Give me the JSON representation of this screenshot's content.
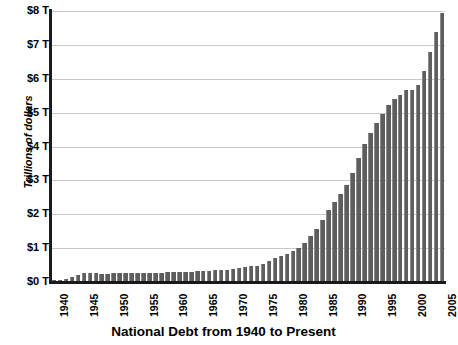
{
  "chart_data": {
    "type": "bar",
    "title": "National Debt from 1940 to Present",
    "xlabel": "",
    "ylabel": "Trillions of dollars",
    "ylim": [
      0,
      8
    ],
    "grid": true,
    "legend": "none",
    "y_ticks": [
      "$0 T",
      "$1 T",
      "$2 T",
      "$3 T",
      "$4 T",
      "$5 T",
      "$6 T",
      "$7 T",
      "$8 T"
    ],
    "y_tick_values": [
      0,
      1,
      2,
      3,
      4,
      5,
      6,
      7,
      8
    ],
    "x_tick_labels": [
      "1940",
      "1945",
      "1950",
      "1955",
      "1960",
      "1965",
      "1970",
      "1975",
      "1980",
      "1985",
      "1990",
      "1995",
      "2000",
      "2005"
    ],
    "x_tick_values": [
      1940,
      1945,
      1950,
      1955,
      1960,
      1965,
      1970,
      1975,
      1980,
      1985,
      1990,
      1995,
      2000,
      2005
    ],
    "units": "trillions of US dollars",
    "categories": [
      1940,
      1941,
      1942,
      1943,
      1944,
      1945,
      1946,
      1947,
      1948,
      1949,
      1950,
      1951,
      1952,
      1953,
      1954,
      1955,
      1956,
      1957,
      1958,
      1959,
      1960,
      1961,
      1962,
      1963,
      1964,
      1965,
      1966,
      1967,
      1968,
      1969,
      1970,
      1971,
      1972,
      1973,
      1974,
      1975,
      1976,
      1977,
      1978,
      1979,
      1980,
      1981,
      1982,
      1983,
      1984,
      1985,
      1986,
      1987,
      1988,
      1989,
      1990,
      1991,
      1992,
      1993,
      1994,
      1995,
      1996,
      1997,
      1998,
      1999,
      2000,
      2001,
      2002,
      2003,
      2004,
      2005
    ],
    "values": [
      0.05,
      0.06,
      0.08,
      0.14,
      0.2,
      0.26,
      0.27,
      0.26,
      0.25,
      0.25,
      0.26,
      0.26,
      0.26,
      0.27,
      0.27,
      0.27,
      0.27,
      0.27,
      0.28,
      0.29,
      0.29,
      0.29,
      0.3,
      0.31,
      0.32,
      0.32,
      0.33,
      0.34,
      0.35,
      0.35,
      0.37,
      0.4,
      0.43,
      0.46,
      0.48,
      0.54,
      0.63,
      0.71,
      0.78,
      0.83,
      0.91,
      1.0,
      1.14,
      1.37,
      1.56,
      1.82,
      2.12,
      2.35,
      2.6,
      2.86,
      3.23,
      3.67,
      4.06,
      4.41,
      4.69,
      4.97,
      5.22,
      5.41,
      5.53,
      5.66,
      5.67,
      5.81,
      6.23,
      6.78,
      7.38,
      7.93
    ],
    "bar_color": "#6b6b6b",
    "gridline_color": "#c8c8c8",
    "axis_color": "#1a1a1a",
    "background_color": "#ffffff"
  }
}
